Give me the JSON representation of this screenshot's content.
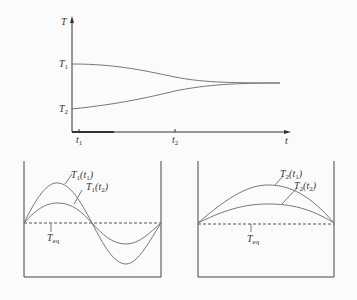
{
  "top_plot": {
    "y_axis_label": "T",
    "x_axis_label": "t",
    "y_ticks": [
      {
        "label": "T",
        "sub": "1"
      },
      {
        "label": "T",
        "sub": "2"
      }
    ],
    "x_ticks": [
      {
        "label": "t",
        "sub": "1"
      },
      {
        "label": "t",
        "sub": "2"
      }
    ]
  },
  "left_panel": {
    "curve1_label": {
      "main": "T",
      "sub": "1",
      "arg": "t",
      "argsub": "1"
    },
    "curve2_label": {
      "main": "T",
      "sub": "1",
      "arg": "t",
      "argsub": "2"
    },
    "eq_label": {
      "main": "T",
      "sub": "eq"
    }
  },
  "right_panel": {
    "curve1_label": {
      "main": "T",
      "sub": "2",
      "arg": "t",
      "argsub": "1"
    },
    "curve2_label": {
      "main": "T",
      "sub": "2",
      "arg": "t",
      "argsub": "2"
    },
    "eq_label": {
      "main": "T",
      "sub": "eq"
    }
  },
  "colors": {
    "line": "#777777",
    "axis": "#333333"
  }
}
